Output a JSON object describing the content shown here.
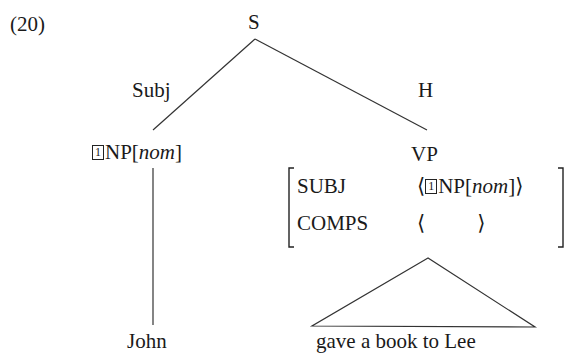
{
  "example_number": "(20)",
  "tree": {
    "root": {
      "label": "S"
    },
    "edges": [
      {
        "label": "Subj",
        "from": "S",
        "to": "NP"
      },
      {
        "label": "H",
        "from": "S",
        "to": "VP"
      }
    ],
    "subject_node": {
      "tag": "1",
      "category": "NP",
      "feature": "nom",
      "leaf": "John"
    },
    "head_node": {
      "category": "VP",
      "avm": {
        "rows": [
          {
            "attr": "SUBJ",
            "value_open": "⟨",
            "tag": "1",
            "value_cat": "NP",
            "value_feature": "nom",
            "value_close": "⟩"
          },
          {
            "attr": "COMPS",
            "value_open": "⟨",
            "value_close": "⟩"
          }
        ]
      },
      "triangle_leaf": "gave a book to Lee"
    }
  },
  "colors": {
    "ink": "#1a1a1a",
    "line": "#333333",
    "background": "#ffffff"
  }
}
